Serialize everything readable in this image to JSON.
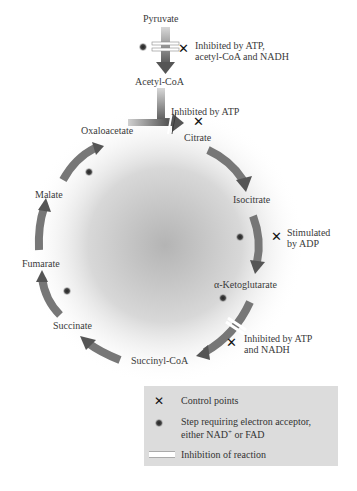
{
  "diagram": {
    "entry": {
      "from": "Pyruvate",
      "to": "Acetyl-CoA",
      "note_line1": "Inhibited by ATP,",
      "note_line2": "acetyl-CoA and NADH"
    },
    "citrate_note": "Inhibited by ATP",
    "isocitrate_note_line1": "Stimulated",
    "isocitrate_note_line2": "by ADP",
    "akg_note_line1": "Inhibited by ATP",
    "akg_note_line2": "and NADH",
    "metabolites": {
      "oxaloacetate": "Oxaloacetate",
      "citrate": "Citrate",
      "isocitrate": "Isocitrate",
      "akg": "α-Ketoglutarate",
      "succinyl_coa": "Succinyl-CoA",
      "succinate": "Succinate",
      "fumarate": "Fumarate",
      "malate": "Malate"
    },
    "x_symbol": "✕"
  },
  "legend": {
    "control_points": "Control points",
    "electron_acceptor_line1": "Step requiring electron acceptor,",
    "electron_acceptor_line2_pre": "either NAD",
    "electron_acceptor_sup": "+",
    "electron_acceptor_line2_post": " or FAD",
    "inhibition": "Inhibition of reaction"
  },
  "colors": {
    "arrow_dark": "#555555",
    "arrow_light": "#d8d8d8",
    "center_gray": "#b0b0b0",
    "legend_bg": "#dcdcdc"
  }
}
